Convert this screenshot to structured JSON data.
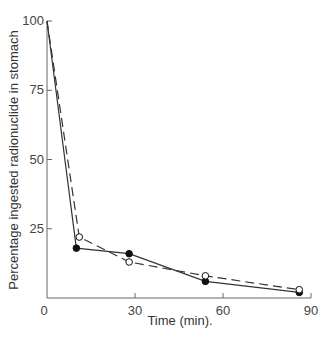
{
  "chart_data": {
    "type": "line",
    "title": "",
    "xlabel": "Time (min).",
    "ylabel": "Percentage ingested radionuclide in stomach",
    "xlim": [
      0,
      90
    ],
    "ylim": [
      0,
      100
    ],
    "x_ticks": [
      0,
      30,
      60,
      90
    ],
    "y_ticks": [
      25,
      50,
      75,
      100
    ],
    "x_tick_labels": [
      "0",
      "30",
      "60",
      "90"
    ],
    "y_tick_labels": [
      "25",
      "50",
      "75",
      "100"
    ],
    "grid": false,
    "legend": null,
    "series": [
      {
        "name": "Filled circles (solid line)",
        "marker": "filled-circle",
        "line_style": "solid",
        "x": [
          0,
          10,
          28,
          54,
          86
        ],
        "y": [
          100,
          18,
          16,
          6,
          2
        ]
      },
      {
        "name": "Open circles (dashed line)",
        "marker": "open-circle",
        "line_style": "dashed",
        "x": [
          0,
          11,
          28,
          54,
          86
        ],
        "y": [
          100,
          22,
          13,
          8,
          3
        ]
      }
    ]
  },
  "colors": {
    "line": "#333333",
    "axis": "#666666"
  }
}
